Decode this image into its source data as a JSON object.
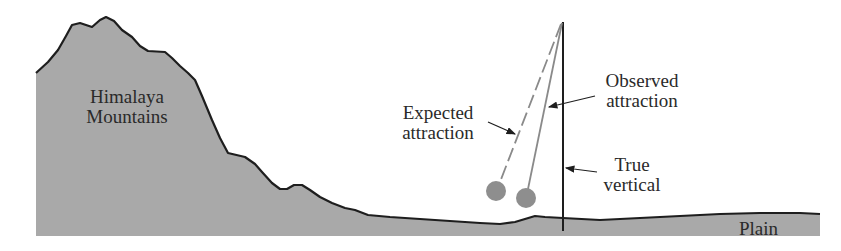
{
  "diagram": {
    "labels": {
      "mountains_line1": "Himalaya",
      "mountains_line2": "Mountains",
      "expected_line1": "Expected",
      "expected_line2": "attraction",
      "observed_line1": "Observed",
      "observed_line2": "attraction",
      "true_line1": "True",
      "true_line2": "vertical",
      "plain": "Plain"
    },
    "colors": {
      "terrain_fill": "#a9a9a9",
      "outline": "#1e1e1e",
      "bob": "#8e8e8e",
      "pendulum_line": "#8a8a8a"
    },
    "elements": [
      "Himalaya Mountains terrain profile",
      "Plain ground",
      "True vertical line",
      "Observed attraction pendulum (solid)",
      "Expected attraction pendulum (dashed)"
    ]
  }
}
